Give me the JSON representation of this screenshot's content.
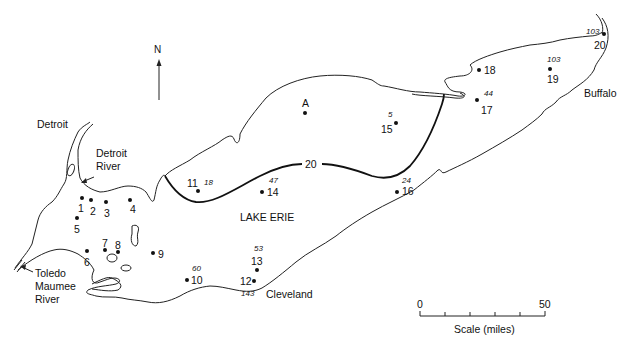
{
  "map": {
    "title": "LAKE ERIE",
    "north_label": "N",
    "places": {
      "detroit": "Detroit",
      "detroit_river_1": "Detroit",
      "detroit_river_2": "River",
      "toledo": "Toledo",
      "maumee": "Maumee",
      "river": "River",
      "cleveland": "Cleveland",
      "buffalo": "Buffalo"
    },
    "contour_label": "20",
    "stations": [
      {
        "id": "1",
        "x": 82,
        "y": 198,
        "lx": 78,
        "ly": 203,
        "depth": null
      },
      {
        "id": "2",
        "x": 91,
        "y": 200,
        "lx": 90,
        "ly": 206,
        "depth": null
      },
      {
        "id": "3",
        "x": 106,
        "y": 202,
        "lx": 104,
        "ly": 208,
        "depth": null
      },
      {
        "id": "4",
        "x": 130,
        "y": 200,
        "lx": 130,
        "ly": 204,
        "depth": null
      },
      {
        "id": "5",
        "x": 77,
        "y": 218,
        "lx": 74,
        "ly": 224,
        "depth": null
      },
      {
        "id": "6",
        "x": 87,
        "y": 251,
        "lx": 84,
        "ly": 257,
        "depth": null
      },
      {
        "id": "7",
        "x": 105,
        "y": 250,
        "lx": 102,
        "ly": 238,
        "depth": null
      },
      {
        "id": "8",
        "x": 118,
        "y": 252,
        "lx": 115,
        "ly": 240,
        "depth": null
      },
      {
        "id": "9",
        "x": 153,
        "y": 253,
        "lx": 158,
        "ly": 249,
        "depth": null
      },
      {
        "id": "10",
        "x": 187,
        "y": 280,
        "lx": 191,
        "ly": 275,
        "depth": "60"
      },
      {
        "id": "11",
        "x": 198,
        "y": 191,
        "lx": 187,
        "ly": 178,
        "depth": "18"
      },
      {
        "id": "12",
        "x": 254,
        "y": 281,
        "lx": 240,
        "ly": 276,
        "depth": "143"
      },
      {
        "id": "13",
        "x": 257,
        "y": 270,
        "lx": 251,
        "ly": 256,
        "depth": "53"
      },
      {
        "id": "14",
        "x": 262,
        "y": 192,
        "lx": 267,
        "ly": 187,
        "depth": "47"
      },
      {
        "id": "15",
        "x": 396,
        "y": 123,
        "lx": 381,
        "ly": 124,
        "depth": "5"
      },
      {
        "id": "16",
        "x": 397,
        "y": 192,
        "lx": 402,
        "ly": 186,
        "depth": "24"
      },
      {
        "id": "17",
        "x": 477,
        "y": 100,
        "lx": 481,
        "ly": 105,
        "depth": "44"
      },
      {
        "id": "18",
        "x": 479,
        "y": 70,
        "lx": 484,
        "ly": 65,
        "depth": null
      },
      {
        "id": "19",
        "x": 550,
        "y": 69,
        "lx": 547,
        "ly": 74,
        "depth": "103"
      },
      {
        "id": "20",
        "x": 604,
        "y": 34,
        "lx": 594,
        "ly": 40,
        "depth": "103"
      }
    ],
    "reference_point": {
      "id": "A",
      "x": 305,
      "y": 113
    },
    "scale": {
      "min_label": "0",
      "max_label": "50",
      "title": "Scale (miles)",
      "ticks": 6
    }
  }
}
